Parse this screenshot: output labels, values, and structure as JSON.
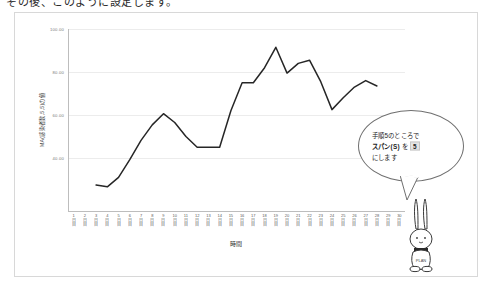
{
  "page": {
    "cropped_heading": "その後、このように設定します。"
  },
  "chart_data": {
    "type": "line",
    "title": "",
    "xlabel": "時間",
    "ylabel": "MA(感染者数,5,5)の値",
    "ylim": [
      30,
      110
    ],
    "yticks": [
      "40.00",
      "60.00",
      "80.00",
      "100.00"
    ],
    "ytick_values": [
      40,
      60,
      80,
      100
    ],
    "grid": true,
    "legend": "none",
    "x_unit": "日目",
    "categories": [
      "1",
      "2",
      "3",
      "4",
      "5",
      "6",
      "7",
      "8",
      "9",
      "10",
      "11",
      "12",
      "13",
      "14",
      "15",
      "16",
      "17",
      "18",
      "19",
      "20",
      "21",
      "22",
      "23",
      "24",
      "25",
      "26",
      "27",
      "28",
      "29",
      "30"
    ],
    "series": [
      {
        "name": "MA(感染者数,5,5)",
        "color": "#262626",
        "values": [
          null,
          null,
          37.4,
          36.6,
          41.0,
          49.2,
          58.2,
          65.4,
          70.6,
          66.5,
          60.0,
          55.0,
          55.0,
          55.0,
          72.0,
          85.0,
          85.0,
          92.0,
          101.5,
          89.5,
          94.0,
          95.5,
          85.5,
          72.5,
          78.0,
          83.0,
          86.0,
          83.5,
          null,
          null
        ]
      }
    ]
  },
  "callout": {
    "line1": "手順5のところで",
    "line2_prefix": "スパン(S)",
    "line2_mid": "を",
    "line2_value": "5",
    "line3": "にします"
  },
  "mascot": {
    "name": "rabbit-mascot",
    "body_label": "PLAN"
  },
  "colors": {
    "line": "#262626",
    "grid": "#ececec",
    "axis": "#bdbdbd",
    "frame": "#d8d8d8",
    "highlight": "#e4e4e4"
  }
}
